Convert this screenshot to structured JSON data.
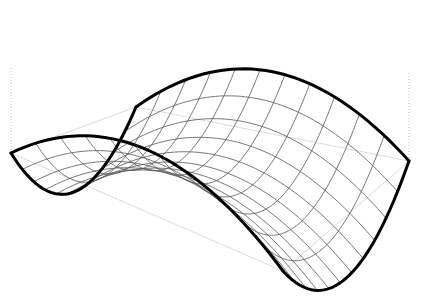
{
  "figure": {
    "title": "",
    "background_color": "#ffffff",
    "width": 421,
    "height": 303
  },
  "chart_data": {
    "type": "surface",
    "title": "",
    "xlabel": "",
    "ylabel": "",
    "zlabel": "",
    "projection": "3d-axonometric",
    "grid": true,
    "legend": false,
    "axes_visible": false,
    "tick_labels": [],
    "nx": 12,
    "ny": 12,
    "xlim": [
      -1,
      1
    ],
    "ylim": [
      -1,
      1
    ],
    "zlim": [
      -1,
      1
    ],
    "surface_function": "z = x*x - y*y",
    "x": [
      -1,
      -0.8182,
      -0.6364,
      -0.4545,
      -0.2727,
      -0.0909,
      0.0909,
      0.2727,
      0.4545,
      0.6364,
      0.8182,
      1
    ],
    "y": [
      -1,
      -0.8182,
      -0.6364,
      -0.4545,
      -0.2727,
      -0.0909,
      0.0909,
      0.2727,
      0.4545,
      0.6364,
      0.8182,
      1
    ],
    "z": [
      [
        0,
        -0.3306,
        -0.595,
        -0.7934,
        -0.9256,
        -0.9917,
        -0.9917,
        -0.9256,
        -0.7934,
        -0.595,
        -0.3306,
        0
      ],
      [
        0.3306,
        0,
        -0.2645,
        -0.4628,
        -0.595,
        -0.6612,
        -0.6612,
        -0.595,
        -0.4628,
        -0.2645,
        0,
        0.3306
      ],
      [
        0.595,
        0.2645,
        0,
        -0.1983,
        -0.3306,
        -0.3967,
        -0.3967,
        -0.3306,
        -0.1983,
        0,
        0.2645,
        0.595
      ],
      [
        0.7934,
        0.4628,
        0.1983,
        0,
        -0.1322,
        -0.1983,
        -0.1983,
        -0.1322,
        0,
        0.1983,
        0.4628,
        0.7934
      ],
      [
        0.9256,
        0.595,
        0.3306,
        0.1322,
        0,
        -0.0661,
        -0.0661,
        0,
        0.1322,
        0.3306,
        0.595,
        0.9256
      ],
      [
        0.9917,
        0.6612,
        0.3967,
        0.1983,
        0.0661,
        0,
        0,
        0.0661,
        0.1983,
        0.3967,
        0.6612,
        0.9917
      ],
      [
        0.9917,
        0.6612,
        0.3967,
        0.1983,
        0.0661,
        0,
        0,
        0.0661,
        0.1983,
        0.3967,
        0.6612,
        0.9917
      ],
      [
        0.9256,
        0.595,
        0.3306,
        0.1322,
        0,
        -0.0661,
        -0.0661,
        0,
        0.1322,
        0.3306,
        0.595,
        0.9256
      ],
      [
        0.7934,
        0.4628,
        0.1983,
        0,
        -0.1322,
        -0.1983,
        -0.1983,
        -0.1322,
        0,
        0.1983,
        0.4628,
        0.7934
      ],
      [
        0.595,
        0.2645,
        0,
        -0.1983,
        -0.3306,
        -0.3967,
        -0.3967,
        -0.3306,
        -0.1983,
        0,
        0.2645,
        0.595
      ],
      [
        0.3306,
        0,
        -0.2645,
        -0.4628,
        -0.595,
        -0.6612,
        -0.6612,
        -0.595,
        -0.4628,
        -0.2645,
        0,
        0.3306
      ],
      [
        0,
        -0.3306,
        -0.595,
        -0.7934,
        -0.9256,
        -0.9917,
        -0.9917,
        -0.9256,
        -0.7934,
        -0.595,
        -0.3306,
        0
      ]
    ],
    "colors": {
      "mesh_line": "#555555",
      "boundary_line": "#000000",
      "base_plane_line": "#cccccc",
      "drop_line": "#bbbbbb",
      "background": "#ffffff"
    },
    "line_widths": {
      "mesh": 0.8,
      "boundary": 3.0,
      "base_plane": 0.7,
      "drop_line": 0.9
    },
    "screen_corners": {
      "surface_top": [
        136,
        14
      ],
      "surface_left": [
        11,
        68
      ],
      "surface_right": [
        409,
        73
      ],
      "surface_bottom": [
        283,
        288
      ],
      "base_top": [
        136,
        107
      ],
      "base_left": [
        11,
        153
      ],
      "base_right": [
        409,
        161
      ],
      "base_bottom": [
        283,
        271
      ]
    }
  }
}
